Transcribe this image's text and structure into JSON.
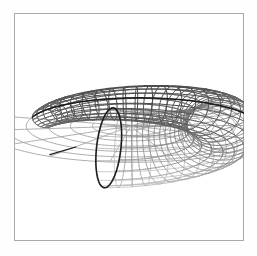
{
  "figure": {
    "title": "",
    "background_color": "#fefefe",
    "plot_background_color": "#ffffff",
    "frame_color": "#a9a9a9",
    "frame": {
      "x": 14,
      "y": 13,
      "width": 230,
      "height": 228
    }
  },
  "chart_data": {
    "type": "line",
    "subtype": "3d-wireframe-surface",
    "title": "",
    "subtitle": "",
    "xlabel": "",
    "ylabel": "",
    "zlabel": "",
    "grid": false,
    "legend": null,
    "axes_visible": false,
    "tick_labels": [],
    "annotations": [],
    "surface": {
      "name": "collapsing torus",
      "parametric_form": "x = (R + r(u)*cos v)*cos u,  y = (R + r(u)*cos v)*sin u,  z = r(u)*sin v",
      "u_range": [
        0,
        6.283185
      ],
      "v_range": [
        0,
        6.283185
      ],
      "u_steps": 36,
      "v_steps": 20,
      "major_radius_R": 1.0,
      "tube_radius_start": 0.58,
      "tube_radius_end": 0.0,
      "cut_angle_deg": 96
    },
    "projection": {
      "type": "orthographic",
      "elevation_deg": 28,
      "azimuth_deg": 104,
      "center_px": [
        116,
        112
      ],
      "scale_px": 92,
      "z_scale_px": 74
    },
    "series": [
      {
        "name": "front-upper-mesh",
        "role": "near side of tube, fully shaded",
        "stroke": "#4a4a4a",
        "stroke_width": 0.85,
        "n_u_lines": 37,
        "n_v_lines": 21
      },
      {
        "name": "back-lower-mesh",
        "role": "far side / underside of tube, occluded, drawn faint",
        "stroke": "#c6c6c6",
        "stroke_width": 0.7,
        "n_u_lines": 37,
        "n_v_lines": 21
      },
      {
        "name": "flat-sector-mesh",
        "role": "degenerate planar polar grid where tube radius = 0",
        "stroke": "#9a9a9a",
        "stroke_width": 0.8,
        "n_radial_lines": 10,
        "n_arc_lines": 6
      },
      {
        "name": "silhouette",
        "role": "outer rim and cut edges highlighted",
        "stroke": "#1d1d1d",
        "stroke_width": 1.7
      }
    ],
    "colors": {
      "mesh_near": "#4a4a4a",
      "mesh_mid": "#7d7d7d",
      "mesh_far": "#c6c6c6",
      "flat_sector": "#9a9a9a",
      "silhouette": "#1d1d1d",
      "background": "#ffffff",
      "frame": "#a9a9a9"
    }
  }
}
